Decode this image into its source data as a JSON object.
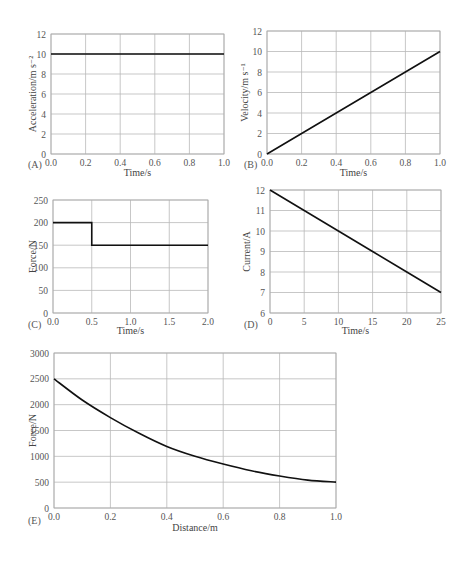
{
  "chart_data": [
    {
      "id": "A",
      "panel_label": "(A)",
      "type": "line",
      "xlabel": "Time/s",
      "ylabel": "Acceleration/m s⁻²",
      "xlim": [
        0,
        1.0
      ],
      "ylim": [
        0,
        12
      ],
      "xticks": [
        "0.0",
        "0.2",
        "0.4",
        "0.6",
        "0.8",
        "1.0"
      ],
      "yticks": [
        "0",
        "2",
        "4",
        "6",
        "8",
        "10",
        "12"
      ],
      "grid": true,
      "x": [
        0.0,
        1.0
      ],
      "y": [
        10,
        10
      ]
    },
    {
      "id": "B",
      "panel_label": "(B)",
      "type": "line",
      "xlabel": "Time/s",
      "ylabel": "Velocity/m s⁻¹",
      "xlim": [
        0,
        1.0
      ],
      "ylim": [
        0,
        12
      ],
      "xticks": [
        "0.0",
        "0.2",
        "0.4",
        "0.6",
        "0.8",
        "1.0"
      ],
      "yticks": [
        "0",
        "2",
        "4",
        "6",
        "8",
        "10",
        "12"
      ],
      "grid": true,
      "x": [
        0.0,
        0.2,
        0.4,
        0.6,
        0.8,
        1.0
      ],
      "y": [
        0,
        2,
        4,
        6,
        8,
        10
      ]
    },
    {
      "id": "C",
      "panel_label": "(C)",
      "type": "line",
      "xlabel": "Time/s",
      "ylabel": "Force/N",
      "xlim": [
        0,
        2.0
      ],
      "ylim": [
        0,
        250
      ],
      "xticks": [
        "0.0",
        "0.5",
        "1.0",
        "1.5",
        "2.0"
      ],
      "yticks": [
        "0",
        "50",
        "100",
        "150",
        "200",
        "250"
      ],
      "grid": true,
      "x": [
        0.0,
        0.5,
        0.5,
        2.0
      ],
      "y": [
        200,
        200,
        150,
        150
      ]
    },
    {
      "id": "D",
      "panel_label": "(D)",
      "type": "line",
      "xlabel": "Time/s",
      "ylabel": "Current/A",
      "xlim": [
        0,
        25
      ],
      "ylim": [
        6,
        12
      ],
      "xticks": [
        "0",
        "5",
        "10",
        "15",
        "20",
        "25"
      ],
      "yticks": [
        "6",
        "7",
        "8",
        "9",
        "10",
        "11",
        "12"
      ],
      "grid": true,
      "x": [
        0,
        5,
        10,
        15,
        20,
        25
      ],
      "y": [
        12,
        11,
        10,
        9,
        8,
        7
      ]
    },
    {
      "id": "E",
      "panel_label": "(E)",
      "type": "line",
      "xlabel": "Distance/m",
      "ylabel": "Force/N",
      "xlim": [
        0,
        1.0
      ],
      "ylim": [
        0,
        3000
      ],
      "xticks": [
        "0.0",
        "0.2",
        "0.4",
        "0.6",
        "0.8",
        "1.0"
      ],
      "yticks": [
        "0",
        "500",
        "1000",
        "1500",
        "2000",
        "2500",
        "3000"
      ],
      "grid": true,
      "x": [
        0.0,
        0.1,
        0.2,
        0.3,
        0.4,
        0.5,
        0.6,
        0.7,
        0.8,
        0.9,
        1.0
      ],
      "y": [
        2500,
        2090,
        1750,
        1450,
        1190,
        1000,
        850,
        720,
        620,
        540,
        500
      ]
    }
  ]
}
